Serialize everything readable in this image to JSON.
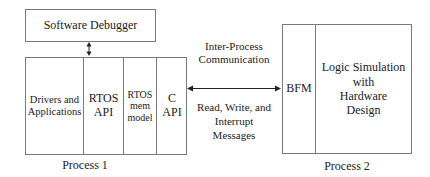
{
  "software_debugger": {
    "label": "Software Debugger"
  },
  "process1": {
    "caption": "Process 1",
    "cells": [
      {
        "line1": "Drivers and",
        "line2": "Applications",
        "line3": ""
      },
      {
        "line1": "RTOS",
        "line2": "API",
        "line3": ""
      },
      {
        "line1": "RTOS",
        "line2": "mem",
        "line3": "model"
      },
      {
        "line1": "C",
        "line2": "API",
        "line3": ""
      }
    ]
  },
  "process2": {
    "caption": "Process 2",
    "bfm": "BFM",
    "logic": {
      "line1": "Logic Simulation",
      "line2": "with",
      "line3": "Hardware",
      "line4": "Design"
    }
  },
  "ipc": {
    "top_line1": "Inter-Process",
    "top_line2": "Communication",
    "bottom_line1": "Read, Write, and",
    "bottom_line2": "Interrupt",
    "bottom_line3": "Messages"
  },
  "colors": {
    "border": "#7a7a7a",
    "text": "#222222",
    "arrow": "#222222"
  }
}
